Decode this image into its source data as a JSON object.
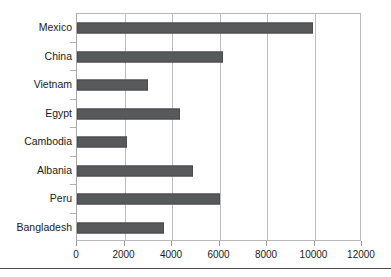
{
  "figure": {
    "clipped_caption": "",
    "bar_color": "#58595b",
    "grid_color": "#bdbdbf",
    "frame_color": "#b9b9bb",
    "text_color": "#1b1b1b"
  },
  "chart_data": {
    "type": "bar",
    "orientation": "horizontal",
    "title": "",
    "subtitle": "",
    "xlabel": "",
    "ylabel": "",
    "categories": [
      "Mexico",
      "China",
      "Vietnam",
      "Egypt",
      "Cambodia",
      "Albania",
      "Peru",
      "Bangladesh"
    ],
    "values": [
      9950,
      6150,
      2980,
      4350,
      2100,
      4900,
      6000,
      3650
    ],
    "series": [
      {
        "name": "",
        "values": [
          9950,
          6150,
          2980,
          4350,
          2100,
          4900,
          6000,
          3650
        ]
      }
    ],
    "xlim": [
      0,
      12000
    ],
    "xticks": [
      0,
      2000,
      4000,
      6000,
      8000,
      10000,
      12000
    ],
    "xticklabels": [
      "0",
      "2000",
      "4000",
      "6000",
      "8000",
      "10000",
      "12000"
    ],
    "grid": true,
    "grid_axis": "x",
    "legend": false,
    "legend_position": "none",
    "annotations": []
  }
}
